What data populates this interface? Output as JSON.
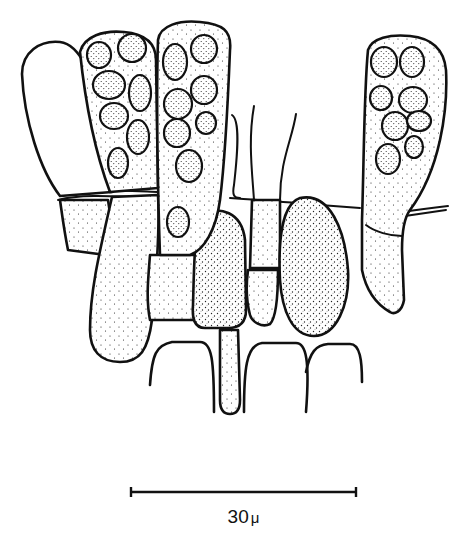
{
  "figure": {
    "colors": {
      "ink": "#111111",
      "background": "#ffffff"
    }
  },
  "scale_bar": {
    "value": "30",
    "unit": "μ",
    "label": "30 μ"
  }
}
